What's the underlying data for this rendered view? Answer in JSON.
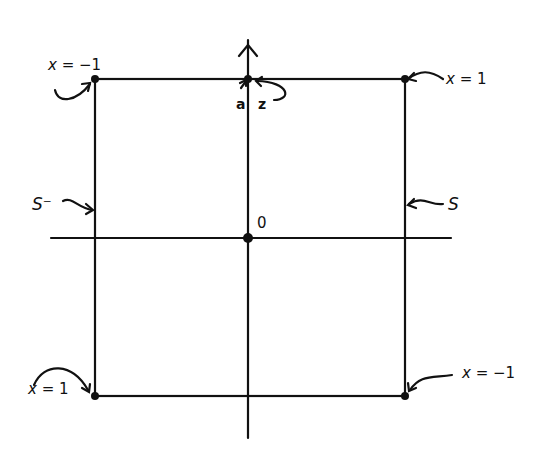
{
  "diagram": {
    "origin_label": "0",
    "corners": {
      "top_left": "x = −1",
      "top_right": "x = 1",
      "bottom_left": "x = 1",
      "bottom_right": "x = −1"
    },
    "sides": {
      "left": "S⁻",
      "right": "S"
    },
    "top_points": {
      "left": "a",
      "right": "z"
    },
    "colors": {
      "ink": "#111111",
      "background": "#ffffff"
    }
  }
}
